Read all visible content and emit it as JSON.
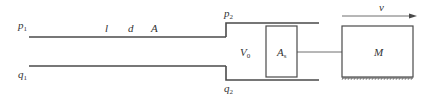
{
  "diagram": {
    "colors": {
      "stroke": "#4a4a4a",
      "text": "#333333",
      "background": "#ffffff"
    },
    "labels": {
      "p1": {
        "main": "p",
        "sub": "1"
      },
      "q1": {
        "main": "q",
        "sub": "1"
      },
      "p2": {
        "main": "p",
        "sub": "2"
      },
      "q2": {
        "main": "q",
        "sub": "2"
      },
      "pipe_length": "l",
      "pipe_diameter": "d",
      "pipe_area": "A",
      "chamber_volume": {
        "main": "V",
        "sub": "0"
      },
      "piston_area": {
        "main": "A",
        "sub": "s"
      },
      "mass": "M",
      "velocity": "v"
    },
    "components": [
      {
        "id": "pipeline",
        "type": "pipe",
        "params": [
          "l",
          "d",
          "A"
        ]
      },
      {
        "id": "cylinder-chamber",
        "type": "chamber",
        "volume": "V0"
      },
      {
        "id": "piston",
        "type": "piston",
        "area": "As"
      },
      {
        "id": "rod",
        "type": "connector"
      },
      {
        "id": "mass",
        "type": "load",
        "label": "M",
        "ground": "hatched"
      },
      {
        "id": "velocity-arrow",
        "type": "arrow",
        "direction": "right",
        "label": "v"
      }
    ]
  }
}
